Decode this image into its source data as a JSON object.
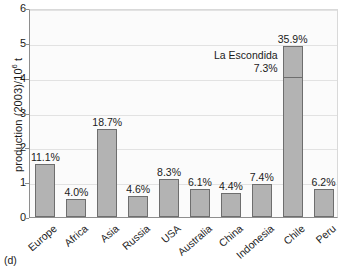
{
  "panel_tag": "(d)",
  "chart_data": {
    "type": "bar",
    "title": "",
    "xlabel": "",
    "ylabel": "production (2003)/10⁶ t",
    "ylabel_parts": {
      "pre": "production (2003)/10",
      "sup": "6",
      "post": " t"
    },
    "ylim": [
      0,
      6
    ],
    "yticks": [
      0,
      1,
      2,
      3,
      4,
      5,
      6
    ],
    "ytick_labels": [
      "0",
      "1",
      "2",
      "3",
      "4",
      "5",
      "6"
    ],
    "grid": true,
    "grid_axis": "y",
    "legend": "none",
    "categories": [
      "Europe",
      "Africa",
      "Asia",
      "Russia",
      "USA",
      "Australia",
      "China",
      "Indonesia",
      "Chile",
      "Peru"
    ],
    "values": [
      1.52,
      0.52,
      2.54,
      0.6,
      1.1,
      0.8,
      0.68,
      0.95,
      4.92,
      0.8
    ],
    "data_labels": [
      "11.1%",
      "4.0%",
      "18.7%",
      "4.6%",
      "8.3%",
      "6.1%",
      "4.4%",
      "7.4%",
      "35.9%",
      "6.2%"
    ],
    "annotations": [
      {
        "target_category": "Chile",
        "line1": "La Escondida",
        "line2": "7.3%",
        "segment_value": 0.95,
        "segment_base": 3.97
      }
    ],
    "colors": {
      "bar_fill": "#b3b3b3",
      "bar_edge": "#6e6e6e",
      "plot_background": "#fbfbfb",
      "gridline": "#e2e2e2",
      "axis": "#8e8e8e",
      "text": "#1a1a1a"
    }
  }
}
